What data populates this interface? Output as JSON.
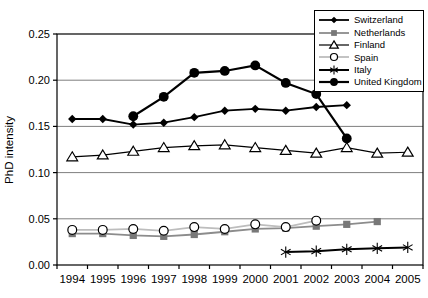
{
  "chart_data": {
    "type": "line",
    "title": "",
    "xlabel": "",
    "ylabel": "PhD intensity",
    "ylim": [
      0,
      0.25
    ],
    "ytick_step": 0.05,
    "ytick_labels": [
      "0.00",
      "0.05",
      "0.10",
      "0.15",
      "0.20",
      "0.25"
    ],
    "grid": "horizontal",
    "legend_position": "top-right",
    "colors": {
      "axis": "#000000",
      "gridline": "#7f7f7f",
      "background": "#ffffff"
    },
    "categories": [
      "1994",
      "1995",
      "1996",
      "1997",
      "1998",
      "1999",
      "2000",
      "2001",
      "2002",
      "2003",
      "2004",
      "2005"
    ],
    "series": [
      {
        "name": "Switzerland",
        "marker": "diamond-filled",
        "line_color": "#000000",
        "marker_color": "#000000",
        "values": [
          0.158,
          0.158,
          0.152,
          0.154,
          0.16,
          0.167,
          0.169,
          0.167,
          0.171,
          0.173,
          null,
          null
        ]
      },
      {
        "name": "Netherlands",
        "marker": "square-filled",
        "line_color": "#8c8c8c",
        "marker_color": "#787878",
        "values": [
          0.034,
          0.034,
          0.032,
          0.031,
          0.033,
          0.036,
          0.039,
          0.04,
          0.042,
          0.044,
          0.047,
          null
        ]
      },
      {
        "name": "Finland",
        "marker": "triangle-open",
        "line_color": "#000000",
        "marker_color": "#ffffff",
        "values": [
          0.117,
          0.119,
          0.123,
          0.127,
          0.129,
          0.13,
          0.127,
          0.124,
          0.121,
          0.127,
          0.121,
          0.122
        ]
      },
      {
        "name": "Spain",
        "marker": "circle-open",
        "line_color": "#bdbdbd",
        "marker_color": "#ffffff",
        "values": [
          0.038,
          0.038,
          0.039,
          0.037,
          0.041,
          0.039,
          0.044,
          0.041,
          0.048,
          null,
          null,
          null
        ]
      },
      {
        "name": "Italy",
        "marker": "asterisk",
        "line_color": "#000000",
        "marker_color": "#000000",
        "values": [
          null,
          null,
          null,
          null,
          null,
          null,
          null,
          0.014,
          0.015,
          0.017,
          0.018,
          0.019
        ]
      },
      {
        "name": "United Kingdom",
        "marker": "circle-filled",
        "line_color": "#000000",
        "marker_color": "#000000",
        "values": [
          null,
          null,
          0.161,
          0.182,
          0.208,
          0.21,
          0.216,
          0.197,
          0.185,
          0.137,
          null,
          null
        ]
      }
    ]
  }
}
